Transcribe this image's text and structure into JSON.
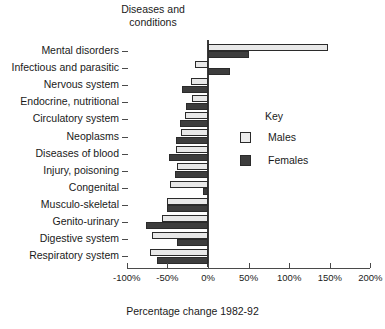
{
  "chart_data": {
    "type": "bar",
    "orientation": "horizontal",
    "title": "Diseases and\nconditions",
    "xlabel": "Percentage change 1982-92",
    "ylabel": "",
    "xlim": [
      -100,
      200
    ],
    "xticks": [
      -100,
      -50,
      0,
      50,
      100,
      150,
      200
    ],
    "xticklabels": [
      "-100%",
      "-50%",
      "0%",
      "50%",
      "100%",
      "150%",
      "200%"
    ],
    "grid": false,
    "legend": {
      "title": "Key",
      "position": "inside-right"
    },
    "categories": [
      "Mental disorders",
      "Infectious and parasitic",
      "Nervous system",
      "Endocrine, nutritional",
      "Circulatory system",
      "Neoplasms",
      "Diseases of blood",
      "Injury, poisoning",
      "Congenital",
      "Musculo-skeletal",
      "Genito-urinary",
      "Digestive system",
      "Respiratory system"
    ],
    "series": [
      {
        "name": "Males",
        "color": "#e8e8e8",
        "values": [
          148,
          -16,
          -21,
          -20,
          -28,
          -33,
          -39,
          -38,
          -47,
          -50,
          -57,
          -69,
          -72
        ]
      },
      {
        "name": "Females",
        "color": "#3d3d3d",
        "values": [
          50,
          27,
          -32,
          -27,
          -35,
          -40,
          -48,
          -41,
          -6,
          -50,
          -76,
          -38,
          -63
        ]
      }
    ]
  },
  "legend": {
    "title": "Key",
    "items": [
      {
        "label": "Males",
        "swatch": "males"
      },
      {
        "label": "Females",
        "swatch": "females"
      }
    ]
  }
}
